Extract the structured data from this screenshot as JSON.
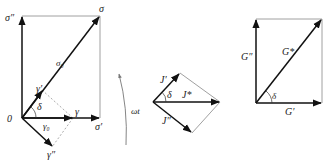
{
  "diagram": {
    "left": {
      "origin_label": "0",
      "sigma_label": "σ",
      "sigma_pp_label": "σ″",
      "sigma_p_label": "σ′",
      "sigma0_label": "σ₀",
      "gamma_label": "γ",
      "gamma_p_label": "γ′",
      "gamma_pp_label": "γ″",
      "gamma0_label": "γ₀",
      "delta_label": "δ"
    },
    "rotation": {
      "label": "ωt"
    },
    "middle": {
      "j_p_label": "J′",
      "j_star_label": "J*",
      "j_pp_label": "J″",
      "delta_label": "δ"
    },
    "right": {
      "g_pp_label": "G″",
      "g_star_label": "G*",
      "g_p_label": "G′",
      "delta_label": "δ"
    }
  }
}
